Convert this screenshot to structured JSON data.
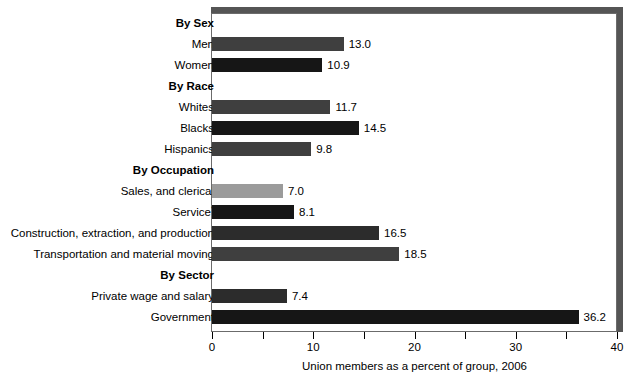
{
  "chart_data": {
    "type": "bar",
    "orientation": "horizontal",
    "title": "",
    "xlabel": "Union members as a percent of group, 2006",
    "ylabel": "",
    "xlim": [
      0,
      40
    ],
    "xticks": [
      0,
      5,
      10,
      15,
      20,
      25,
      30,
      35,
      40
    ],
    "xtick_labels": [
      "0",
      "",
      "10",
      "",
      "20",
      "",
      "30",
      "",
      "40"
    ],
    "grid": false,
    "legend": "none",
    "footnote_marker": "*",
    "rows": [
      {
        "label": "By Sex",
        "kind": "header",
        "value": null,
        "value_label": "",
        "color": ""
      },
      {
        "label": "Men",
        "kind": "bar",
        "value": 13.0,
        "value_label": "13.0",
        "color": "#3f3f3f"
      },
      {
        "label": "Women",
        "kind": "bar",
        "value": 10.9,
        "value_label": "10.9",
        "color": "#161616"
      },
      {
        "label": "By Race",
        "kind": "header",
        "value": null,
        "value_label": "",
        "color": ""
      },
      {
        "label": "Whites",
        "kind": "bar",
        "value": 11.7,
        "value_label": "11.7",
        "color": "#3f3f3f"
      },
      {
        "label": "Blacks",
        "kind": "bar",
        "value": 14.5,
        "value_label": "14.5",
        "color": "#161616"
      },
      {
        "label": "Hispanics",
        "kind": "bar",
        "value": 9.8,
        "value_label": "9.8",
        "color": "#3f3f3f"
      },
      {
        "label": "By Occupation",
        "kind": "header",
        "value": null,
        "value_label": "",
        "color": ""
      },
      {
        "label": "Sales, and clerical",
        "kind": "bar",
        "value": 7.0,
        "value_label": "7.0",
        "color": "#9b9b9b"
      },
      {
        "label": "Service",
        "kind": "bar",
        "value": 8.1,
        "value_label": "8.1",
        "color": "#161616",
        "superscript": "*"
      },
      {
        "label": "Construction, extraction, and production",
        "kind": "bar",
        "value": 16.5,
        "value_label": "16.5",
        "color": "#2c2c2c"
      },
      {
        "label": "Transportation and material moving",
        "kind": "bar",
        "value": 18.5,
        "value_label": "18.5",
        "color": "#3f3f3f"
      },
      {
        "label": "By Sector",
        "kind": "header",
        "value": null,
        "value_label": "",
        "color": ""
      },
      {
        "label": "Private wage and salary",
        "kind": "bar",
        "value": 7.4,
        "value_label": "7.4",
        "color": "#2c2c2c"
      },
      {
        "label": "Government",
        "kind": "bar",
        "value": 36.2,
        "value_label": "36.2",
        "color": "#161616"
      },
      {
        "label": "",
        "kind": "spacer",
        "value": null,
        "value_label": "",
        "color": ""
      }
    ],
    "categories": [
      "Men",
      "Women",
      "Whites",
      "Blacks",
      "Hispanics",
      "Sales, and clerical",
      "Service",
      "Construction, extraction, and production",
      "Transportation and material moving",
      "Private wage and salary",
      "Government"
    ],
    "values": [
      13.0,
      10.9,
      11.7,
      14.5,
      9.8,
      7.0,
      8.1,
      16.5,
      18.5,
      7.4,
      36.2
    ],
    "groups": [
      {
        "name": "By Sex",
        "categories": [
          "Men",
          "Women"
        ],
        "values": [
          13.0,
          10.9
        ]
      },
      {
        "name": "By Race",
        "categories": [
          "Whites",
          "Blacks",
          "Hispanics"
        ],
        "values": [
          11.7,
          14.5,
          9.8
        ]
      },
      {
        "name": "By Occupation",
        "categories": [
          "Sales, and clerical",
          "Service",
          "Construction, extraction, and production",
          "Transportation and material moving"
        ],
        "values": [
          7.0,
          8.1,
          16.5,
          18.5
        ]
      },
      {
        "name": "By Sector",
        "categories": [
          "Private wage and salary",
          "Government"
        ],
        "values": [
          7.4,
          36.2
        ]
      }
    ]
  }
}
